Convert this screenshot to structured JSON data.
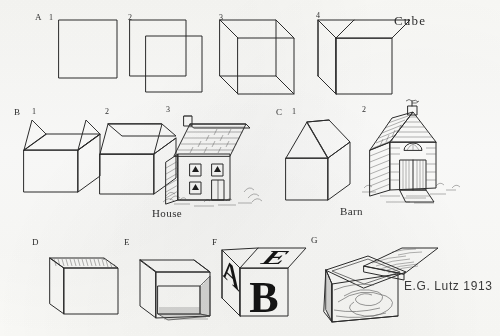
{
  "plate": {
    "title": "Cube Drawing Plate",
    "signature": "E.G. Lutz  1913",
    "background_color": "#fdfdfc",
    "ink_color": "#2b2b2b"
  },
  "rows": [
    {
      "letter": "A",
      "subject_label": "Cube",
      "steps": [
        {
          "num": "1",
          "caption": "square"
        },
        {
          "num": "2",
          "caption": "offset second square"
        },
        {
          "num": "3",
          "caption": "connect corners, transparent cube"
        },
        {
          "num": "4",
          "caption": "finished cube"
        }
      ]
    },
    {
      "letter": "B",
      "subject_label": "House",
      "steps": [
        {
          "num": "1",
          "caption": "box with gable ends"
        },
        {
          "num": "2",
          "caption": "roof planes added"
        },
        {
          "num": "3",
          "caption": "finished house with shingles, windows, door, chimney"
        }
      ]
    },
    {
      "letter": "C",
      "subject_label": "Barn",
      "steps": [
        {
          "num": "1",
          "caption": "box with tall gable roof"
        },
        {
          "num": "2",
          "caption": "finished barn with siding, big door, weather vane"
        }
      ]
    },
    {
      "letter": "D",
      "subject_label": "",
      "steps": [
        {
          "num": "",
          "caption": "open box seen from above"
        }
      ]
    },
    {
      "letter": "E",
      "subject_label": "",
      "steps": [
        {
          "num": "",
          "caption": "open box interior, front removed"
        }
      ]
    },
    {
      "letter": "F",
      "subject_label": "",
      "steps": [
        {
          "num": "",
          "caption": "alphabet block"
        }
      ]
    },
    {
      "letter": "G",
      "subject_label": "",
      "steps": [
        {
          "num": "",
          "caption": "wooden box with hinged lid open"
        }
      ]
    }
  ],
  "block_letters": {
    "front": "B",
    "left": "A",
    "top": "E"
  }
}
